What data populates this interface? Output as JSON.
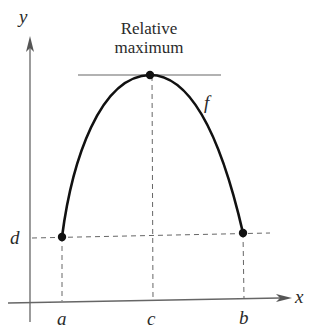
{
  "diagram": {
    "type": "function-graph",
    "annotation": {
      "line1": "Relative",
      "line2": "maximum"
    },
    "function_label": "f",
    "axes": {
      "x_label": "x",
      "y_label": "y"
    },
    "x_ticks": [
      "a",
      "c",
      "b"
    ],
    "y_ticks": [
      "d"
    ],
    "points": [
      {
        "name": "left-endpoint",
        "x": "a",
        "y": "d"
      },
      {
        "name": "relative-maximum",
        "x": "c",
        "y": "f(c)"
      },
      {
        "name": "right-endpoint",
        "x": "b",
        "y": "d"
      }
    ],
    "colors": {
      "curve": "#111111",
      "axes": "#555555",
      "dashed": "#555555",
      "text": "#2a2a2a"
    }
  }
}
